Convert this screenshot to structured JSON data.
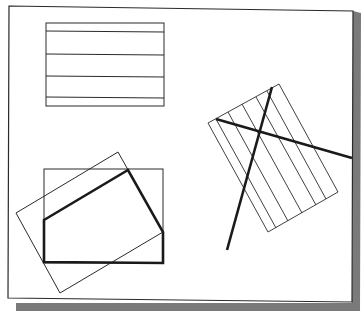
{
  "figure": {
    "colors": {
      "background": "#ffffff",
      "stroke": "#2a2a2a",
      "shadow": "#7a7a7a"
    },
    "shapes": [
      {
        "name": "hatched-rectangle",
        "type": "rectangle",
        "x": 46,
        "y": 23,
        "w": 118,
        "h": 83,
        "hatch_lines_y": [
          31,
          54,
          76,
          97
        ]
      },
      {
        "name": "rotated-hatched-rectangle",
        "type": "polygon",
        "points": [
          [
            208,
            123
          ],
          [
            279,
            84
          ],
          [
            338,
            192
          ],
          [
            268,
            232
          ]
        ],
        "hatch_count": 6
      },
      {
        "name": "crossing-line-1",
        "type": "line",
        "from": [
          216,
          119
        ],
        "to": [
          352,
          158
        ],
        "thick": true
      },
      {
        "name": "crossing-line-2",
        "type": "line",
        "from": [
          272,
          87
        ],
        "to": [
          227,
          250
        ],
        "thick": true
      },
      {
        "name": "upright-rectangle",
        "type": "rectangle",
        "x": 44,
        "y": 169,
        "w": 119,
        "h": 94
      },
      {
        "name": "rotated-rectangle",
        "type": "polygon",
        "points": [
          [
            118,
            152
          ],
          [
            163,
            232
          ],
          [
            60,
            293
          ],
          [
            16,
            213
          ]
        ]
      },
      {
        "name": "pentagon",
        "type": "polygon",
        "points": [
          [
            44,
            220
          ],
          [
            128,
            170
          ],
          [
            163,
            232
          ],
          [
            163,
            263
          ],
          [
            44,
            262
          ]
        ],
        "thick": true
      }
    ]
  }
}
